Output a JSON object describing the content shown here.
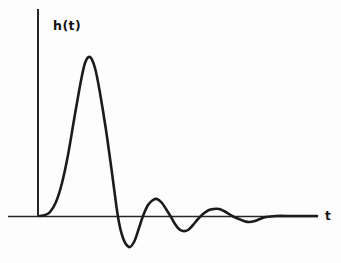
{
  "figure": {
    "background": "#fdfdfd",
    "curve_color": "#1b1b1b",
    "axis_color": "#262626",
    "label_color": "#111111"
  },
  "chart_data": {
    "type": "line",
    "title": "",
    "xlabel": "t",
    "ylabel": "h(t)",
    "grid": false,
    "legend_position": "none",
    "x_ticks": [],
    "y_ticks": [],
    "xlim": [
      0,
      10
    ],
    "ylim": [
      -0.25,
      1.1
    ],
    "series": [
      {
        "name": "h(t)",
        "x": [
          0,
          0.25,
          0.5,
          0.8,
          1.1,
          1.4,
          1.79,
          2.2,
          2.6,
          2.82,
          3.05,
          3.25,
          3.5,
          3.75,
          4.0,
          4.21,
          4.5,
          4.71,
          5.0,
          5.18,
          5.5,
          5.86,
          6.2,
          6.43,
          6.7,
          6.96,
          7.2,
          7.5,
          7.8,
          8.15,
          9.0,
          10.0
        ],
        "y": [
          0,
          0.01,
          0.1,
          0.35,
          0.66,
          0.92,
          1.0,
          0.81,
          0.28,
          0,
          -0.14,
          -0.19,
          -0.13,
          0,
          0.08,
          0.11,
          0.06,
          0,
          -0.07,
          -0.09,
          -0.05,
          0,
          0.03,
          0.05,
          0.02,
          0,
          -0.02,
          -0.04,
          -0.02,
          0,
          0,
          0
        ]
      }
    ],
    "points_px": [
      [
        40,
        216
      ],
      [
        45,
        215
      ],
      [
        50,
        212
      ],
      [
        56,
        202
      ],
      [
        62,
        183
      ],
      [
        68,
        155
      ],
      [
        74,
        120
      ],
      [
        80,
        86
      ],
      [
        85,
        63
      ],
      [
        90,
        57
      ],
      [
        95,
        68
      ],
      [
        100,
        93
      ],
      [
        106,
        130
      ],
      [
        112,
        173
      ],
      [
        118,
        217
      ],
      [
        123,
        238
      ],
      [
        129,
        247
      ],
      [
        134,
        242
      ],
      [
        139,
        228
      ],
      [
        143,
        216
      ],
      [
        148,
        205
      ],
      [
        153,
        200
      ],
      [
        157,
        199
      ],
      [
        162,
        203
      ],
      [
        166,
        209
      ],
      [
        171,
        217
      ],
      [
        175,
        224
      ],
      [
        179,
        229
      ],
      [
        183,
        231
      ],
      [
        188,
        230
      ],
      [
        193,
        225
      ],
      [
        198,
        219
      ],
      [
        203,
        214
      ],
      [
        209,
        210
      ],
      [
        214,
        209
      ],
      [
        219,
        209
      ],
      [
        224,
        211
      ],
      [
        229,
        214
      ],
      [
        234,
        217
      ],
      [
        239,
        219
      ],
      [
        244,
        221
      ],
      [
        249,
        222
      ],
      [
        255,
        221
      ],
      [
        260,
        219
      ],
      [
        266,
        217
      ],
      [
        276,
        216
      ],
      [
        292,
        216
      ],
      [
        308,
        216
      ],
      [
        317,
        216
      ]
    ],
    "axes_px": {
      "y_axis": {
        "x": 38,
        "y_top": 9,
        "y_bottom": 217
      },
      "x_axis": {
        "x_left": 8,
        "x_right": 318,
        "y": 216.5
      }
    }
  }
}
